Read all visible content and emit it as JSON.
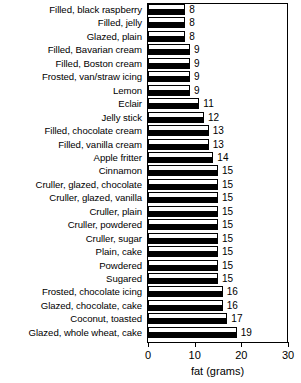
{
  "chart_data": {
    "type": "bar",
    "orientation": "horizontal",
    "title": "",
    "xlabel": "fat (grams)",
    "ylabel": "",
    "xlim": [
      0,
      30
    ],
    "xticks": [
      0,
      10,
      20,
      30
    ],
    "xticklabels": [
      "0",
      "10",
      "20",
      "30"
    ],
    "grid": false,
    "legend": false,
    "categories": [
      "Filled, black raspberry",
      "Filled, jelly",
      "Glazed, plain",
      "Filled, Bavarian cream",
      "Filled, Boston cream",
      "Frosted, van/straw icing",
      "Lemon",
      "Eclair",
      "Jelly stick",
      "Filled, chocolate cream",
      "Filled, vanilla cream",
      "Apple fritter",
      "Cinnamon",
      "Cruller, glazed, chocolate",
      "Cruller, glazed, vanilla",
      "Cruller, plain",
      "Cruller, powdered",
      "Cruller, sugar",
      "Plain, cake",
      "Powdered",
      "Sugared",
      "Frosted, chocolate icing",
      "Glazed, chocolate, cake",
      "Coconut, toasted",
      "Glazed, whole wheat, cake"
    ],
    "values": [
      8,
      8,
      8,
      9,
      9,
      9,
      9,
      11,
      12,
      13,
      13,
      14,
      15,
      15,
      15,
      15,
      15,
      15,
      15,
      15,
      15,
      16,
      16,
      17,
      19
    ],
    "datalabels": [
      "8",
      "8",
      "8",
      "9",
      "9",
      "9",
      "9",
      "11",
      "12",
      "13",
      "13",
      "14",
      "15",
      "15",
      "15",
      "15",
      "15",
      "15",
      "15",
      "15",
      "15",
      "16",
      "16",
      "17",
      "19"
    ],
    "bar_fill": "#ffffff",
    "bar_edge": "#000000",
    "bar_shadow": "#000000",
    "frame_color": "#000000",
    "background": "#ffffff"
  }
}
